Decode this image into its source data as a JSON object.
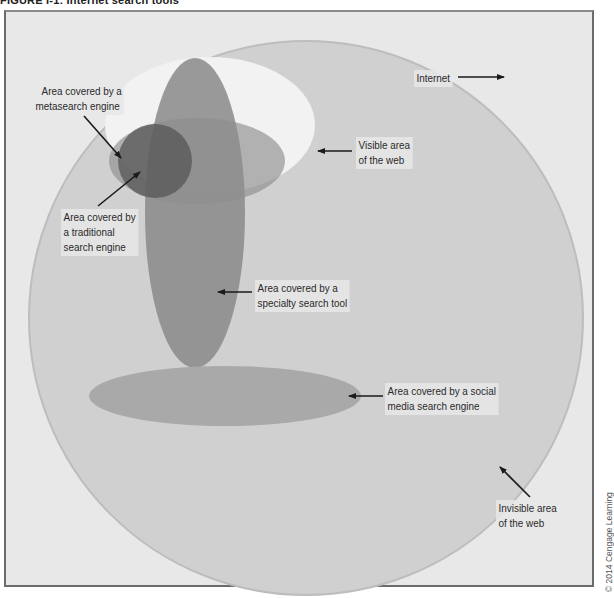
{
  "figure": {
    "title": "FIGURE I-1: Internet search tools",
    "credit": "© 2014 Cengage Learning"
  },
  "labels": {
    "internet": "Internet",
    "metasearch": [
      "Area covered by a",
      "metasearch engine"
    ],
    "visible_web": [
      "Visible area",
      "of the web"
    ],
    "traditional": [
      "Area covered by",
      "a traditional",
      "search engine"
    ],
    "specialty": [
      "Area covered by a",
      "specialty search tool"
    ],
    "social_media": [
      "Area covered by a social",
      "media search engine"
    ],
    "invisible_web": [
      "Invisible area",
      "of the web"
    ]
  },
  "colors": {
    "background": "#e8e8e8",
    "internet_circle": "#cfcfcf",
    "visible_area": "#f3f3f3",
    "specialty_ellipse": "#8d8d8d",
    "traditional_ellipse": "#9e9e9e",
    "metasearch_circle": "#6e6e6e",
    "social_media_ellipse": "#b2b2b2",
    "frame_border": "#6b6b6b"
  }
}
